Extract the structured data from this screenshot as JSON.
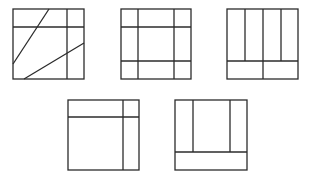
{
  "diagram": {
    "type": "square-partitions",
    "stroke_color": "#2b2b2b",
    "background": "#ffffff",
    "figures": [
      {
        "id": 1,
        "box": [
          13,
          9,
          84,
          79
        ],
        "lines": [
          [
            13,
            27,
            84,
            27
          ],
          [
            67,
            9,
            67,
            79
          ],
          [
            49,
            9,
            13,
            64
          ],
          [
            24,
            79,
            84,
            43
          ]
        ]
      },
      {
        "id": 2,
        "box": [
          121,
          9,
          191,
          79
        ],
        "lines": [
          [
            121,
            27,
            191,
            27
          ],
          [
            121,
            61,
            191,
            61
          ],
          [
            138,
            9,
            138,
            79
          ],
          [
            174,
            9,
            174,
            79
          ]
        ]
      },
      {
        "id": 3,
        "box": [
          227,
          9,
          298,
          79
        ],
        "lines": [
          [
            227,
            61,
            298,
            61
          ],
          [
            245,
            9,
            245,
            61
          ],
          [
            263,
            9,
            263,
            79
          ],
          [
            281,
            9,
            281,
            61
          ]
        ]
      },
      {
        "id": 4,
        "box": [
          68,
          100,
          139,
          170
        ],
        "lines": [
          [
            68,
            117,
            139,
            117
          ],
          [
            123,
            100,
            123,
            170
          ]
        ]
      },
      {
        "id": 5,
        "box": [
          175,
          100,
          247,
          170
        ],
        "lines": [
          [
            175,
            152,
            247,
            152
          ],
          [
            193,
            100,
            193,
            152
          ],
          [
            230,
            100,
            230,
            152
          ]
        ]
      }
    ]
  }
}
